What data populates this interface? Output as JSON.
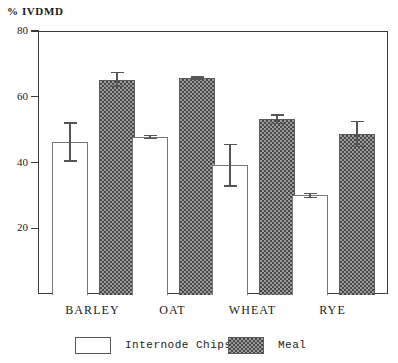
{
  "chart_data": {
    "type": "bar",
    "title": "",
    "xlabel": "",
    "ylabel": "% IVDMD",
    "categories": [
      "BARLEY",
      "OAT",
      "WHEAT",
      "RYE"
    ],
    "ylim": [
      0,
      80
    ],
    "yticks": [
      20,
      40,
      60,
      80
    ],
    "ytick_labels": [
      "20",
      "40",
      "60",
      "80"
    ],
    "grid": false,
    "legend_position": "bottom",
    "series": [
      {
        "name": "Internode Chips",
        "fill": "white",
        "values": [
          46.5,
          48.0,
          39.5,
          30.3
        ],
        "errors": [
          6.0,
          0.7,
          6.5,
          0.8
        ]
      },
      {
        "name": "Meal",
        "fill": "checkered",
        "values": [
          65.5,
          66.0,
          53.5,
          49.0
        ],
        "errors": [
          2.3,
          0.5,
          1.5,
          4.0
        ]
      }
    ]
  },
  "axis": {
    "title": "% IVDMD",
    "ticks": [
      {
        "label": "80",
        "value": 80
      },
      {
        "label": "60",
        "value": 60
      },
      {
        "label": "40",
        "value": 40
      },
      {
        "label": "20",
        "value": 20
      }
    ]
  },
  "groups": [
    {
      "label": "BARLEY",
      "chips": {
        "value": 46.5,
        "error": 6.0
      },
      "meal": {
        "value": 65.5,
        "error": 2.3
      }
    },
    {
      "label": "OAT",
      "chips": {
        "value": 48.0,
        "error": 0.7
      },
      "meal": {
        "value": 66.0,
        "error": 0.5
      }
    },
    {
      "label": "WHEAT",
      "chips": {
        "value": 39.5,
        "error": 6.5
      },
      "meal": {
        "value": 53.5,
        "error": 1.5
      }
    },
    {
      "label": "RYE",
      "chips": {
        "value": 30.3,
        "error": 0.8
      },
      "meal": {
        "value": 49.0,
        "error": 4.0
      }
    }
  ],
  "legend": [
    {
      "label": "Internode Chips",
      "style": "chips"
    },
    {
      "label": "Meal",
      "style": "meal"
    }
  ],
  "colors": {
    "axis": "#3a3a3a",
    "chips_fill": "#ffffff",
    "chips_edge": "#777777",
    "meal_pattern_dark": "#4a4a4a",
    "meal_pattern_light": "#9a9a9a",
    "error_bar": "#555555"
  }
}
